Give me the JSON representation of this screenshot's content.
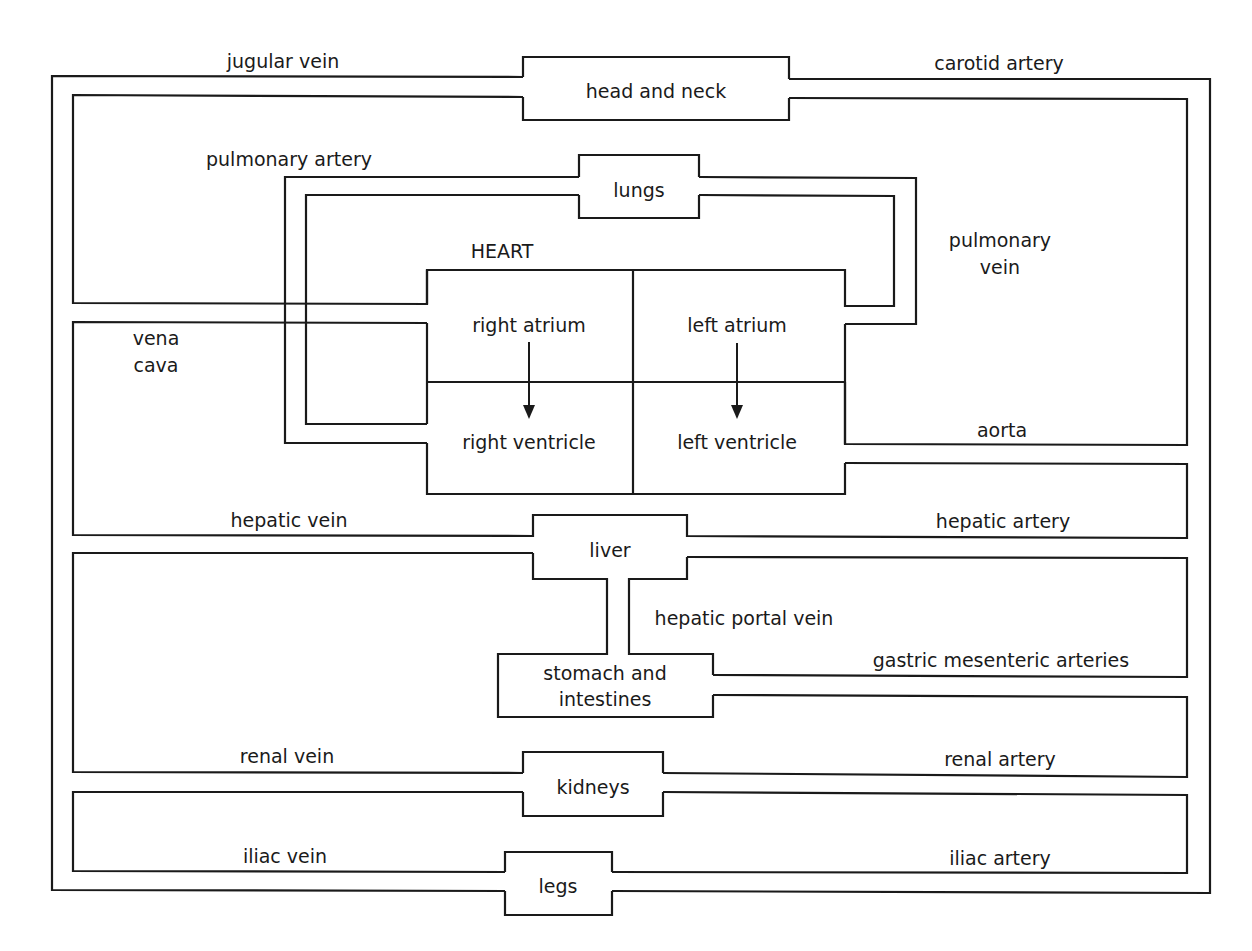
{
  "diagram": {
    "line_color": "#1a1a1a",
    "background": "#ffffff",
    "organs": {
      "head_and_neck": "head and neck",
      "lungs": "lungs",
      "heart": "HEART",
      "liver": "liver",
      "stomach_line1": "stomach and",
      "stomach_line2": "intestines",
      "kidneys": "kidneys",
      "legs": "legs"
    },
    "heart_chambers": {
      "right_atrium": "right atrium",
      "left_atrium": "left atrium",
      "right_ventricle": "right ventricle",
      "left_ventricle": "left ventricle"
    },
    "vessels": {
      "jugular_vein": "jugular vein",
      "carotid_artery": "carotid artery",
      "pulmonary_artery": "pulmonary artery",
      "pulmonary_vein_line1": "pulmonary",
      "pulmonary_vein_line2": "vein",
      "vena_cava_line1": "vena",
      "vena_cava_line2": "cava",
      "aorta": "aorta",
      "hepatic_vein": "hepatic vein",
      "hepatic_artery": "hepatic artery",
      "hepatic_portal_vein": "hepatic portal vein",
      "gastric_mesenteric_arteries": "gastric mesenteric arteries",
      "renal_vein": "renal vein",
      "renal_artery": "renal artery",
      "iliac_vein": "iliac vein",
      "iliac_artery": "iliac artery"
    },
    "flow_arrows": [
      {
        "from": "right atrium",
        "to": "right ventricle"
      },
      {
        "from": "left atrium",
        "to": "left ventricle"
      }
    ]
  }
}
